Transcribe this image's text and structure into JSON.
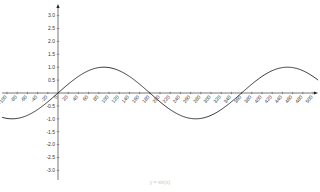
{
  "chart_data": {
    "type": "line",
    "title": "",
    "caption": "y = sin(x)",
    "xlabel": "",
    "ylabel": "",
    "xlim": [
      -100,
      500
    ],
    "ylim": [
      -3.0,
      3.0
    ],
    "grid": false,
    "legend": null,
    "x_ticks": [
      -100,
      -80,
      -60,
      -40,
      -20,
      0,
      20,
      40,
      60,
      80,
      100,
      120,
      140,
      160,
      180,
      200,
      220,
      240,
      260,
      280,
      300,
      320,
      340,
      360,
      380,
      400,
      420,
      440,
      460,
      480,
      500
    ],
    "y_ticks": [
      -3.0,
      -2.5,
      -2.0,
      -1.5,
      -1.0,
      -0.5,
      0.5,
      1.0,
      1.5,
      2.0,
      2.5,
      3.0
    ],
    "y_tick_labels": [
      "-3.0",
      "-2.5",
      "-2.0",
      "-1.5",
      "-1.0",
      "-0.5",
      "0.5",
      "1.0",
      "1.5",
      "2.0",
      "2.5",
      "3.0"
    ],
    "series": [
      {
        "name": "sin(x)",
        "function": "sin(x degrees)",
        "x": [
          -100,
          -90,
          -60,
          -30,
          0,
          30,
          60,
          90,
          120,
          150,
          180,
          210,
          240,
          270,
          300,
          330,
          360,
          390,
          420,
          450,
          480,
          500
        ],
        "values": [
          -0.98,
          -1.0,
          -0.87,
          -0.5,
          0.0,
          0.5,
          0.87,
          1.0,
          0.87,
          0.5,
          0.0,
          -0.5,
          -0.87,
          -1.0,
          -0.87,
          -0.5,
          0.0,
          0.5,
          0.87,
          1.0,
          0.87,
          0.64
        ],
        "color": "#222222"
      }
    ]
  },
  "colors": {
    "axis": "#555555",
    "curve": "#222222",
    "caption": "#c8c8c8"
  }
}
